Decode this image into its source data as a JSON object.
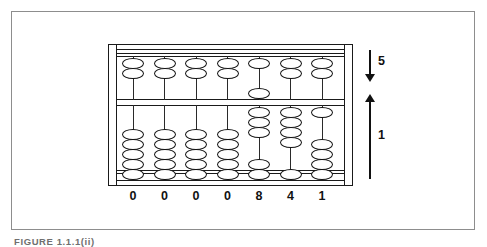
{
  "figure": {
    "caption": "FIGURE 1.1.1(ii)",
    "displayed_number": "0000841"
  },
  "abacus": {
    "upper_bead_value": 5,
    "lower_bead_value": 1,
    "beads_per_upper_rod": 2,
    "beads_per_lower_rod": 5,
    "columns": [
      {
        "digit": "0",
        "upper_active": 0,
        "upper_inactive": 2,
        "lower_active": 0,
        "lower_inactive": 5
      },
      {
        "digit": "0",
        "upper_active": 0,
        "upper_inactive": 2,
        "lower_active": 0,
        "lower_inactive": 5
      },
      {
        "digit": "0",
        "upper_active": 0,
        "upper_inactive": 2,
        "lower_active": 0,
        "lower_inactive": 5
      },
      {
        "digit": "0",
        "upper_active": 0,
        "upper_inactive": 2,
        "lower_active": 0,
        "lower_inactive": 5
      },
      {
        "digit": "8",
        "upper_active": 1,
        "upper_inactive": 1,
        "lower_active": 3,
        "lower_inactive": 2
      },
      {
        "digit": "4",
        "upper_active": 0,
        "upper_inactive": 2,
        "lower_active": 4,
        "lower_inactive": 1
      },
      {
        "digit": "1",
        "upper_active": 0,
        "upper_inactive": 2,
        "lower_active": 1,
        "lower_inactive": 4
      }
    ]
  },
  "annotations": {
    "upper_arrow_label": "5",
    "lower_arrow_label": "1"
  },
  "colors": {
    "ink": "#111111",
    "frame": "#8d8d8d",
    "paper": "#ffffff"
  }
}
